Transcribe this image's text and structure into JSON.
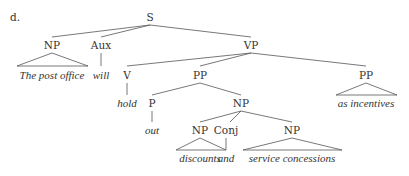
{
  "example_label": "d.",
  "nodes": {
    "s": {
      "label": "S",
      "x": 150,
      "y": 17
    },
    "np_subj": {
      "label": "NP",
      "x": 52,
      "y": 45
    },
    "aux": {
      "label": "Aux",
      "x": 101,
      "y": 45
    },
    "vp": {
      "label": "VP",
      "x": 251,
      "y": 45
    },
    "subj_text": {
      "label": "The post office",
      "x": 49,
      "y": 75
    },
    "aux_text": {
      "label": "will",
      "x": 101,
      "y": 75
    },
    "v": {
      "label": "V",
      "x": 127,
      "y": 75
    },
    "pp1": {
      "label": "PP",
      "x": 200,
      "y": 75
    },
    "pp2": {
      "label": "PP",
      "x": 366,
      "y": 75
    },
    "v_text": {
      "label": "hold",
      "x": 127,
      "y": 103
    },
    "p": {
      "label": "P",
      "x": 152,
      "y": 103
    },
    "np_obj": {
      "label": "NP",
      "x": 241,
      "y": 103
    },
    "pp2_text": {
      "label": "as incentives",
      "x": 366,
      "y": 103
    },
    "p_text": {
      "label": "out",
      "x": 152,
      "y": 130
    },
    "np1": {
      "label": "NP",
      "x": 200,
      "y": 130
    },
    "conj": {
      "label": "Conj",
      "x": 240,
      "y": 130
    },
    "np2": {
      "label": "NP",
      "x": 292,
      "y": 130
    },
    "np1_text": {
      "label": "discounts",
      "x": 200,
      "y": 158
    },
    "conj_text": {
      "label": "and",
      "x": 240,
      "y": 158
    },
    "np2_text": {
      "label": "service concessions",
      "x": 292,
      "y": 158
    }
  }
}
